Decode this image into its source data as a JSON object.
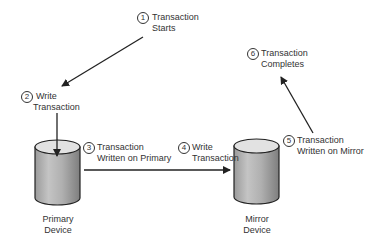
{
  "diagram": {
    "type": "flow",
    "steps": [
      {
        "number": "1",
        "line1": "Transaction",
        "line2": "Starts"
      },
      {
        "number": "2",
        "line1": "Write",
        "line2": "Transaction"
      },
      {
        "number": "3",
        "line1": "Transaction",
        "line2": "Written on Primary"
      },
      {
        "number": "4",
        "line1": "Write",
        "line2": "Transaction"
      },
      {
        "number": "5",
        "line1": "Transaction",
        "line2": "Written on Mirror"
      },
      {
        "number": "6",
        "line1": "Transaction",
        "line2": "Completes"
      }
    ],
    "devices": [
      {
        "line1": "Primary",
        "line2": "Device"
      },
      {
        "line1": "Mirror",
        "line2": "Device"
      }
    ],
    "colors": {
      "line": "#222222",
      "cylinder_body_light": "#d8d8d8",
      "cylinder_body_dark": "#8a8a8a",
      "cylinder_top": "#e4e4e4"
    }
  }
}
